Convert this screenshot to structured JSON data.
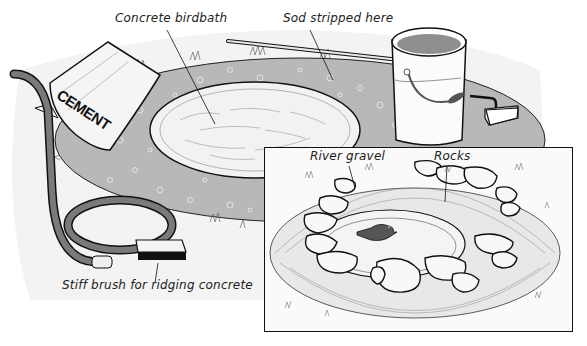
{
  "figure": {
    "type": "illustration",
    "labels": {
      "concrete_birdbath": "Concrete birdbath",
      "sod_stripped": "Sod stripped here",
      "stiff_brush": "Stiff brush for ridging concrete",
      "river_gravel": "River gravel",
      "rocks": "Rocks"
    },
    "cement_bag_text": "CEMENT",
    "inset": {
      "description": "Finished birdbath with bird, ringed by rocks and river gravel"
    },
    "objects": [
      "cement-bag",
      "garden-hose",
      "bucket",
      "hoe",
      "stiff-brush",
      "birdbath-basin",
      "bird"
    ]
  },
  "colors": {
    "sod_area": "#b8b8b8",
    "gravel_dots": "#e6e6e6",
    "concrete": "#f2f2f2",
    "hose": "#7a7a7a",
    "bucket_fill": "#8f8f8f",
    "bird": "#555555",
    "line": "#111111",
    "background": "#ffffff"
  }
}
